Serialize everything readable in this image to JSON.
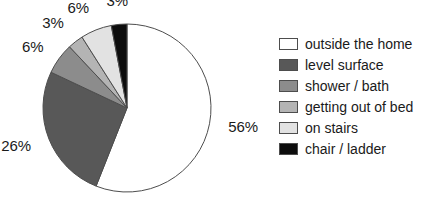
{
  "chart_data": {
    "type": "pie",
    "title": "",
    "subtitle": "",
    "xlabel": "",
    "ylabel": "",
    "legend_position": "right",
    "grid": false,
    "start_angle_deg": 0,
    "direction": "clockwise",
    "categories": [
      "outside the home",
      "level surface",
      "shower / bath",
      "getting out of bed",
      "on stairs",
      "chair / ladder"
    ],
    "values": [
      56,
      26,
      6,
      3,
      6,
      3
    ],
    "value_labels": [
      "56%",
      "26%",
      "6%",
      "3%",
      "6%",
      "3%"
    ],
    "colors": [
      "#ffffff",
      "#585858",
      "#8c8c8c",
      "#b4b4b4",
      "#e2e2e2",
      "#0d0d0d"
    ],
    "slices": [
      {
        "label": "outside the home",
        "value": 56,
        "display": "56%",
        "color": "#ffffff"
      },
      {
        "label": "level surface",
        "value": 26,
        "display": "26%",
        "color": "#585858"
      },
      {
        "label": "shower / bath",
        "value": 6,
        "display": "6%",
        "color": "#8c8c8c"
      },
      {
        "label": "getting out of bed",
        "value": 3,
        "display": "3%",
        "color": "#b4b4b4"
      },
      {
        "label": "on stairs",
        "value": 6,
        "display": "6%",
        "color": "#e2e2e2"
      },
      {
        "label": "chair / ladder",
        "value": 3,
        "display": "3%",
        "color": "#0d0d0d"
      }
    ]
  },
  "geometry": {
    "center_x": 127,
    "center_y": 108,
    "radius": 84,
    "label_radius": 103
  },
  "legend": {
    "items": [
      {
        "label": "outside the home",
        "color": "#ffffff"
      },
      {
        "label": "level surface",
        "color": "#585858"
      },
      {
        "label": "shower / bath",
        "color": "#8c8c8c"
      },
      {
        "label": "getting out of bed",
        "color": "#b4b4b4"
      },
      {
        "label": "on stairs",
        "color": "#e2e2e2"
      },
      {
        "label": "chair / ladder",
        "color": "#0d0d0d"
      }
    ]
  },
  "style": {
    "outline_color": "#4d4d4d",
    "text_color": "#1a1a1a",
    "background": "#ffffff"
  }
}
